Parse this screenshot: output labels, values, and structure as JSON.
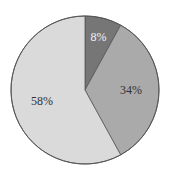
{
  "chart_data": {
    "type": "pie",
    "title": "",
    "categories": [
      "Slice A",
      "Slice B",
      "Slice C"
    ],
    "values": [
      8,
      34,
      58
    ],
    "labels": [
      "8%",
      "34%",
      "58%"
    ],
    "colors": [
      "#767676",
      "#aaaaaa",
      "#dadada"
    ],
    "label_colors": [
      "#f2f2f2",
      "#333333",
      "#333333"
    ],
    "start_angle_deg": 0,
    "direction": "clockwise",
    "outline_color": "#555555",
    "legend": null,
    "center": [
      85,
      90
    ],
    "radius": 74
  }
}
